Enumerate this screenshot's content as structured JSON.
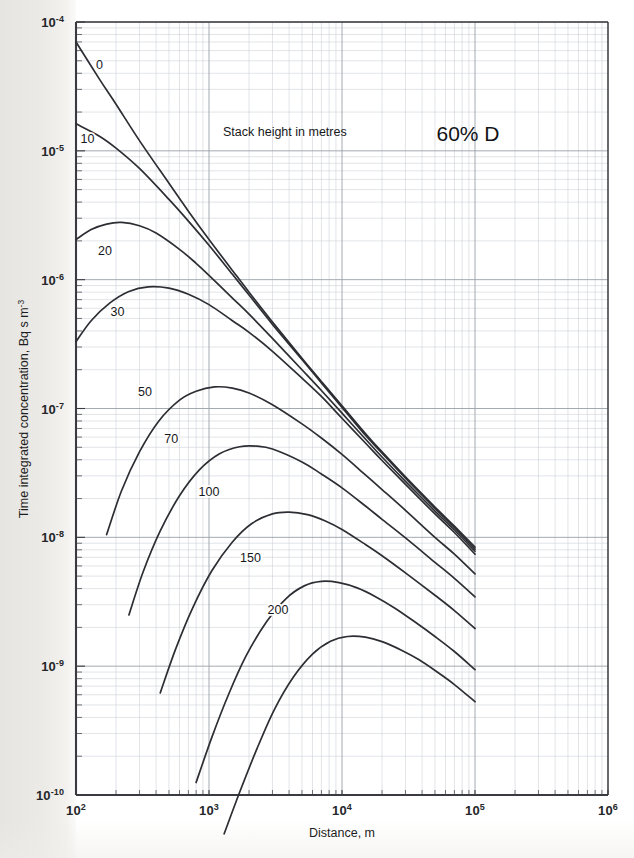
{
  "chart_data": {
    "type": "line",
    "title": "60% D",
    "annotation": "Stack height in metres",
    "xlabel": "Distance, m",
    "ylabel": "Time integrated concentration, Bq s m-3",
    "ylabel_base": "Time integrated concentration, Bq s m",
    "ylabel_sup": "-3",
    "xscale": "log",
    "yscale": "log",
    "xlim": [
      100,
      1000000
    ],
    "ylim": [
      1e-10,
      0.0001
    ],
    "grid": "log-log minor gridlines",
    "legend": "inline curve labels",
    "xticks": [
      {
        "value": 100,
        "mantissa": "10",
        "exponent": "2"
      },
      {
        "value": 1000,
        "mantissa": "10",
        "exponent": "3"
      },
      {
        "value": 10000,
        "mantissa": "10",
        "exponent": "4"
      },
      {
        "value": 100000,
        "mantissa": "10",
        "exponent": "5"
      },
      {
        "value": 1000000,
        "mantissa": "10",
        "exponent": "6"
      }
    ],
    "yticks": [
      {
        "value": 0.0001,
        "mantissa": "10",
        "exponent": "-4"
      },
      {
        "value": 1e-05,
        "mantissa": "10",
        "exponent": "-5"
      },
      {
        "value": 1e-06,
        "mantissa": "10",
        "exponent": "-6"
      },
      {
        "value": 1e-07,
        "mantissa": "10",
        "exponent": "-7"
      },
      {
        "value": 1e-08,
        "mantissa": "10",
        "exponent": "-8"
      },
      {
        "value": 1e-09,
        "mantissa": "10",
        "exponent": "-9"
      },
      {
        "value": 1e-10,
        "mantissa": "10",
        "exponent": "-10"
      }
    ],
    "series": [
      {
        "name": "0",
        "label": "0",
        "label_x": 150,
        "label_y": 4.3e-05,
        "points": [
          [
            100,
            7e-05
          ],
          [
            150,
            3.6e-05
          ],
          [
            200,
            2.3e-05
          ],
          [
            300,
            1.2e-05
          ],
          [
            500,
            5.6e-06
          ],
          [
            700,
            3.4e-06
          ],
          [
            1000,
            2.05e-06
          ],
          [
            1500,
            1.18e-06
          ],
          [
            2000,
            8e-07
          ],
          [
            3000,
            4.7e-07
          ],
          [
            5000,
            2.45e-07
          ],
          [
            7000,
            1.62e-07
          ],
          [
            10000,
            1.05e-07
          ],
          [
            15000,
            6.4e-08
          ],
          [
            20000,
            4.6e-08
          ],
          [
            30000,
            2.95e-08
          ],
          [
            50000,
            1.72e-08
          ],
          [
            70000,
            1.22e-08
          ],
          [
            100000,
            8.4e-09
          ]
        ]
      },
      {
        "name": "10",
        "label": "10",
        "label_x": 122,
        "label_y": 1.15e-05,
        "points": [
          [
            100,
            1.62e-05
          ],
          [
            150,
            1.3e-05
          ],
          [
            200,
            1.05e-05
          ],
          [
            300,
            7.3e-06
          ],
          [
            500,
            4.2e-06
          ],
          [
            700,
            2.85e-06
          ],
          [
            1000,
            1.85e-06
          ],
          [
            1500,
            1.1e-06
          ],
          [
            2000,
            7.6e-07
          ],
          [
            3000,
            4.5e-07
          ],
          [
            5000,
            2.4e-07
          ],
          [
            7000,
            1.58e-07
          ],
          [
            10000,
            1.02e-07
          ],
          [
            15000,
            6.2e-08
          ],
          [
            20000,
            4.5e-08
          ],
          [
            30000,
            2.88e-08
          ],
          [
            50000,
            1.68e-08
          ],
          [
            70000,
            1.19e-08
          ],
          [
            100000,
            8.1e-09
          ]
        ]
      },
      {
        "name": "20",
        "label": "20",
        "label_x": 165,
        "label_y": 1.55e-06,
        "points": [
          [
            100,
            2.05e-06
          ],
          [
            130,
            2.45e-06
          ],
          [
            170,
            2.7e-06
          ],
          [
            220,
            2.78e-06
          ],
          [
            300,
            2.62e-06
          ],
          [
            400,
            2.3e-06
          ],
          [
            600,
            1.72e-06
          ],
          [
            800,
            1.34e-06
          ],
          [
            1000,
            1.08e-06
          ],
          [
            1500,
            7.2e-07
          ],
          [
            2000,
            5.4e-07
          ],
          [
            3000,
            3.5e-07
          ],
          [
            5000,
            2e-07
          ],
          [
            7000,
            1.38e-07
          ],
          [
            10000,
            9.2e-08
          ],
          [
            15000,
            5.8e-08
          ],
          [
            20000,
            4.2e-08
          ],
          [
            30000,
            2.72e-08
          ],
          [
            50000,
            1.6e-08
          ],
          [
            70000,
            1.14e-08
          ],
          [
            100000,
            7.8e-09
          ]
        ]
      },
      {
        "name": "30",
        "label": "30",
        "label_x": 205,
        "label_y": 5.2e-07,
        "points": [
          [
            100,
            3.3e-07
          ],
          [
            130,
            4.8e-07
          ],
          [
            180,
            6.6e-07
          ],
          [
            250,
            8.1e-07
          ],
          [
            350,
            8.8e-07
          ],
          [
            500,
            8.6e-07
          ],
          [
            700,
            7.7e-07
          ],
          [
            1000,
            6.4e-07
          ],
          [
            1500,
            4.8e-07
          ],
          [
            2000,
            3.9e-07
          ],
          [
            3000,
            2.78e-07
          ],
          [
            5000,
            1.72e-07
          ],
          [
            7000,
            1.24e-07
          ],
          [
            10000,
            8.4e-08
          ],
          [
            15000,
            5.4e-08
          ],
          [
            20000,
            3.95e-08
          ],
          [
            30000,
            2.58e-08
          ],
          [
            50000,
            1.52e-08
          ],
          [
            70000,
            1.09e-08
          ],
          [
            100000,
            7.4e-09
          ]
        ]
      },
      {
        "name": "50",
        "label": "50",
        "label_x": 330,
        "label_y": 1.26e-07,
        "points": [
          [
            170,
            1.05e-08
          ],
          [
            220,
            2.3e-08
          ],
          [
            300,
            4.6e-08
          ],
          [
            420,
            8e-08
          ],
          [
            600,
            1.16e-07
          ],
          [
            800,
            1.36e-07
          ],
          [
            1100,
            1.47e-07
          ],
          [
            1500,
            1.44e-07
          ],
          [
            2000,
            1.32e-07
          ],
          [
            3000,
            1.07e-07
          ],
          [
            5000,
            7.6e-08
          ],
          [
            7000,
            5.9e-08
          ],
          [
            10000,
            4.4e-08
          ],
          [
            15000,
            3.05e-08
          ],
          [
            20000,
            2.35e-08
          ],
          [
            30000,
            1.62e-08
          ],
          [
            50000,
            1e-08
          ],
          [
            70000,
            7.4e-09
          ],
          [
            100000,
            5.2e-09
          ]
        ]
      },
      {
        "name": "70",
        "label": "70",
        "label_x": 520,
        "label_y": 5.4e-08,
        "points": [
          [
            250,
            2.5e-09
          ],
          [
            320,
            5.4e-09
          ],
          [
            430,
            1.12e-08
          ],
          [
            600,
            2.1e-08
          ],
          [
            850,
            3.35e-08
          ],
          [
            1200,
            4.45e-08
          ],
          [
            1700,
            5.05e-08
          ],
          [
            2300,
            5.1e-08
          ],
          [
            3000,
            4.85e-08
          ],
          [
            5000,
            3.85e-08
          ],
          [
            7000,
            3.1e-08
          ],
          [
            10000,
            2.42e-08
          ],
          [
            15000,
            1.75e-08
          ],
          [
            20000,
            1.38e-08
          ],
          [
            30000,
            9.9e-09
          ],
          [
            50000,
            6.4e-09
          ],
          [
            70000,
            4.8e-09
          ],
          [
            100000,
            3.45e-09
          ]
        ]
      },
      {
        "name": "100",
        "label": "100",
        "label_x": 1000,
        "label_y": 2.08e-08,
        "points": [
          [
            430,
            6.2e-10
          ],
          [
            560,
            1.35e-09
          ],
          [
            750,
            2.8e-09
          ],
          [
            1050,
            5.5e-09
          ],
          [
            1500,
            9.2e-09
          ],
          [
            2100,
            1.28e-08
          ],
          [
            3000,
            1.52e-08
          ],
          [
            4000,
            1.57e-08
          ],
          [
            5500,
            1.5e-08
          ],
          [
            7500,
            1.34e-08
          ],
          [
            10000,
            1.15e-08
          ],
          [
            15000,
            8.8e-09
          ],
          [
            20000,
            7.2e-09
          ],
          [
            30000,
            5.3e-09
          ],
          [
            50000,
            3.55e-09
          ],
          [
            70000,
            2.7e-09
          ],
          [
            100000,
            1.96e-09
          ]
        ]
      },
      {
        "name": "150",
        "label": "150",
        "label_x": 2050,
        "label_y": 6.4e-09,
        "points": [
          [
            800,
            1.25e-10
          ],
          [
            1050,
            2.8e-10
          ],
          [
            1400,
            6e-10
          ],
          [
            1900,
            1.2e-09
          ],
          [
            2700,
            2.2e-09
          ],
          [
            3800,
            3.35e-09
          ],
          [
            5200,
            4.2e-09
          ],
          [
            7000,
            4.55e-09
          ],
          [
            9500,
            4.45e-09
          ],
          [
            13000,
            4.05e-09
          ],
          [
            18000,
            3.45e-09
          ],
          [
            25000,
            2.82e-09
          ],
          [
            35000,
            2.22e-09
          ],
          [
            50000,
            1.7e-09
          ],
          [
            70000,
            1.3e-09
          ],
          [
            100000,
            9.4e-10
          ]
        ]
      },
      {
        "name": "200",
        "label": "200",
        "label_x": 3300,
        "label_y": 2.55e-09,
        "points": [
          [
            1300,
            5e-11
          ],
          [
            1700,
            1.05e-10
          ],
          [
            2300,
            2.3e-10
          ],
          [
            3100,
            4.6e-10
          ],
          [
            4300,
            8.2e-10
          ],
          [
            6000,
            1.24e-09
          ],
          [
            8200,
            1.56e-09
          ],
          [
            11000,
            1.7e-09
          ],
          [
            15000,
            1.68e-09
          ],
          [
            20000,
            1.55e-09
          ],
          [
            28000,
            1.33e-09
          ],
          [
            38000,
            1.12e-09
          ],
          [
            52000,
            9e-10
          ],
          [
            70000,
            7.2e-10
          ],
          [
            100000,
            5.3e-10
          ]
        ]
      }
    ]
  },
  "figure": {
    "plot_left_px": 76,
    "plot_top_px": 22,
    "plot_right_px": 608,
    "plot_bottom_px": 795
  },
  "colors": {
    "curve": "#2d2e33",
    "axis": "#3a3b40",
    "grid_minor": "#c9cdd4",
    "grid_major": "#9aa0a8",
    "text": "#17181b",
    "page": "#ffffff",
    "scan_band": "#e8e7e4"
  }
}
